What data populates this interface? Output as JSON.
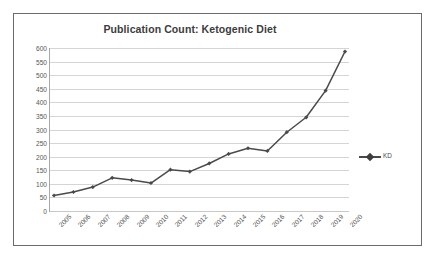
{
  "chart_data": {
    "type": "line",
    "title": "Publication Count: Ketogenic Diet",
    "xlabel": "",
    "ylabel": "",
    "categories": [
      "2005",
      "2006",
      "2007",
      "2008",
      "2009",
      "2010",
      "2011",
      "2012",
      "2013",
      "2014",
      "2015",
      "2016",
      "2017",
      "2018",
      "2019",
      "2020"
    ],
    "series": [
      {
        "name": "KD",
        "values": [
          57,
          70,
          88,
          122,
          114,
          103,
          152,
          145,
          175,
          210,
          231,
          221,
          290,
          345,
          443,
          587
        ]
      }
    ],
    "ylim": [
      0,
      600
    ],
    "ytick_step": 50,
    "yticks": [
      "600",
      "550",
      "500",
      "450",
      "400",
      "350",
      "300",
      "250",
      "200",
      "150",
      "100",
      "50",
      "0"
    ],
    "grid": true,
    "legend_position": "right",
    "marker": "diamond",
    "series_color": "#4a4a4a",
    "grid_color": "#d5d5d5",
    "text_color": "#565656",
    "title_color": "#3c3c3c",
    "border_color": "#6b6b6b",
    "x_label_rotation": "-45"
  },
  "legend": {
    "entries": [
      {
        "label": "KD"
      }
    ]
  }
}
